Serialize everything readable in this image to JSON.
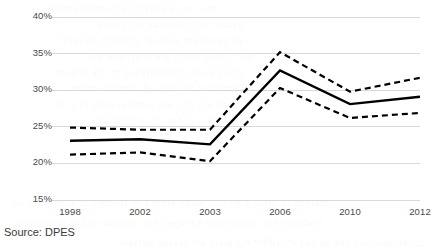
{
  "chart_data": {
    "type": "line",
    "title": "",
    "xlabel": "",
    "ylabel": "",
    "categories": [
      "1998",
      "2002",
      "2003",
      "2006",
      "2010",
      "2012"
    ],
    "x": [
      1998,
      2002,
      2003,
      2006,
      2010,
      2012
    ],
    "ylim": [
      15,
      40
    ],
    "yticks": [
      15,
      20,
      25,
      30,
      35,
      40
    ],
    "ytick_labels": [
      "15%",
      "20%",
      "25%",
      "30%",
      "35%",
      "40%"
    ],
    "grid": true,
    "grid_axis": "y",
    "legend": false,
    "legend_position": "none",
    "series": [
      {
        "name": "Upper confidence bound",
        "style": "dashed",
        "color": "#000000",
        "values": [
          24.9,
          24.6,
          24.6,
          35.2,
          29.8,
          31.7
        ]
      },
      {
        "name": "Estimate",
        "style": "solid",
        "color": "#000000",
        "values": [
          23.1,
          23.3,
          22.6,
          32.7,
          28.1,
          29.1
        ]
      },
      {
        "name": "Lower confidence bound",
        "style": "dashed",
        "color": "#000000",
        "values": [
          21.2,
          21.5,
          20.3,
          30.3,
          26.2,
          26.9
        ]
      }
    ],
    "annotations": []
  },
  "axes": {
    "y_ticks": [
      {
        "label": "40%",
        "value": 40
      },
      {
        "label": "35%",
        "value": 35
      },
      {
        "label": "30%",
        "value": 30
      },
      {
        "label": "25%",
        "value": 25
      },
      {
        "label": "20%",
        "value": 20
      },
      {
        "label": "15%",
        "value": 15
      }
    ],
    "x_ticks": [
      {
        "label": "1998"
      },
      {
        "label": "2002"
      },
      {
        "label": "2003"
      },
      {
        "label": "2006"
      },
      {
        "label": "2010"
      },
      {
        "label": "2012"
      }
    ]
  },
  "footer": {
    "source_label": "Source: DPES"
  },
  "colors": {
    "line": "#000000",
    "grid": "#d9d9d9",
    "text": "#4a4a4a",
    "background": "#ffffff"
  },
  "background_bleed": [
    "allenfeldstetten  en  trends  eutral  han",
    "esting  the  nature  of  the  related",
    "level  of  differing  opinion  measured  in",
    "the  relative  share  of  the  public  that",
    "towards  EU  in  CAMPAIGN  flows  going",
    "more  national  Europe  for  that  provides",
    "it  is  evident  is  about  the  will  the  one",
    "that  another  in  trends  that  may  not",
    "the  difference  in  support  of  a  more  value  will  be  a  point  of  contact",
    "discussion  and  in  support  of  a  negative  conclusion  of  a  standard",
    "interest  across  the  main  CAMPAIGN  period  and  national  trends"
  ]
}
